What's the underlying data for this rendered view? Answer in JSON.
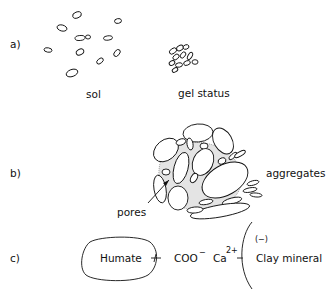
{
  "panels": {
    "a": {
      "label": "a)",
      "sol_label": "sol",
      "gel_label": "gel status"
    },
    "b": {
      "label": "b)",
      "aggregates_label": "aggregates",
      "pores_label": "pores"
    },
    "c": {
      "label": "c)",
      "humate_label": "Humate",
      "carboxylate_label": "COO",
      "carboxylate_charge": "−",
      "calcium_label": "Ca",
      "calcium_charge": "2+",
      "clay_charge_label": "(−)",
      "clay_label": "Clay mineral"
    }
  }
}
